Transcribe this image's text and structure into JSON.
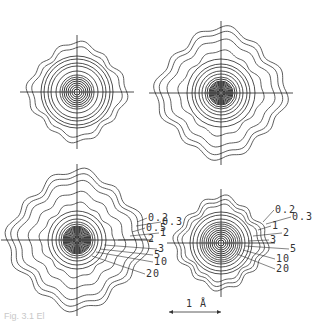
{
  "figure": {
    "caption": "Fig. 3.1 El",
    "scale_bar_label": "1 Å",
    "panels": [
      {
        "id": "top-left",
        "cx": 77,
        "cy": 92,
        "rings": [
          3,
          5,
          7,
          9,
          11,
          13,
          15,
          17,
          21,
          26,
          29,
          33,
          36,
          42,
          47
        ],
        "wavy_outer": 2,
        "labels": []
      },
      {
        "id": "top-right",
        "cx": 221,
        "cy": 93,
        "rings": [
          2,
          3,
          4,
          5,
          6,
          7,
          8,
          9,
          10,
          11,
          12,
          14,
          16,
          19,
          22,
          26,
          29,
          34,
          40,
          50,
          57,
          62
        ],
        "wavy_outer": 4,
        "labels": []
      },
      {
        "id": "bottom-left",
        "cx": 77,
        "cy": 240,
        "rings": [
          2,
          3,
          4,
          5,
          6,
          7,
          8,
          9,
          10,
          11,
          12,
          13,
          14,
          16,
          18,
          21,
          25,
          29,
          35,
          45,
          55,
          61,
          66
        ],
        "wavy_outer": 5,
        "labels": [
          "0.2",
          "0.3",
          "0.5",
          "1",
          "2",
          "3",
          "5",
          "10",
          "20"
        ]
      },
      {
        "id": "bottom-right",
        "cx": 221,
        "cy": 243,
        "rings": [
          3,
          5,
          7,
          9,
          11,
          13,
          15,
          17,
          19,
          21,
          24,
          28,
          31,
          36,
          40,
          44
        ],
        "wavy_outer": 3,
        "labels": [
          "0.2",
          "0.3",
          "1",
          "2",
          "3",
          "5",
          "10",
          "20"
        ]
      }
    ]
  }
}
